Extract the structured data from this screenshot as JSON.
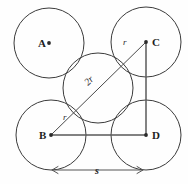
{
  "figure": {
    "width": 188,
    "height": 184,
    "background_color": "#fefefe",
    "stroke_color": "#3b3b3b"
  },
  "vertices": {
    "a": {
      "label": "A",
      "cx": 49,
      "cy": 43,
      "label_x": 38,
      "label_y": 47
    },
    "b": {
      "label": "B",
      "cx": 51,
      "cy": 135,
      "label_x": 39,
      "label_y": 139
    },
    "c": {
      "label": "C",
      "cx": 146,
      "cy": 42,
      "label_x": 152,
      "label_y": 46
    },
    "d": {
      "label": "D",
      "cx": 146,
      "cy": 135,
      "label_x": 152,
      "label_y": 139
    }
  },
  "center_circle": {
    "name": "center-circle",
    "cx": 98,
    "cy": 88,
    "r": 35
  },
  "corner_radius": 35,
  "annotations": {
    "radius_near_b": {
      "text": "r",
      "x": 63,
      "y": 120
    },
    "radius_near_c": {
      "text": "r",
      "x": 123,
      "y": 45
    },
    "diagonal": {
      "text": "2r",
      "x": 88,
      "y": 86,
      "rotation": -44
    },
    "side": {
      "text": "s",
      "x": 97,
      "y": 174
    }
  },
  "dimension": {
    "name": "side-length-dimension",
    "x_start": 52,
    "x_end": 143,
    "y": 170,
    "label": "s"
  }
}
